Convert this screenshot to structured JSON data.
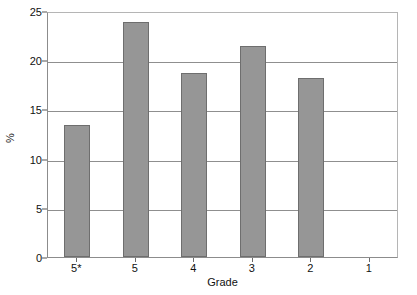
{
  "chart_data": {
    "type": "bar",
    "title": "",
    "subtitle": "",
    "xlabel": "Grade",
    "ylabel": "%",
    "categories": [
      "5*",
      "5",
      "4",
      "3",
      "2",
      "1"
    ],
    "values": [
      13.4,
      23.9,
      18.7,
      21.4,
      18.2,
      0
    ],
    "series": [
      {
        "name": "Percentage of candidates",
        "values": [
          13.4,
          23.9,
          18.7,
          21.4,
          18.2,
          0
        ]
      }
    ],
    "ylim": [
      0,
      25
    ],
    "yticks": [
      0,
      5,
      10,
      15,
      20,
      25
    ],
    "ytick_labels": [
      "0",
      "5",
      "10",
      "15",
      "20",
      "25"
    ],
    "grid": true,
    "grid_axis": "y",
    "legend": false,
    "legend_position": "none",
    "bar_color": "#969696",
    "bar_edge_color": "#6e6e6e",
    "frame_color": "#8c8c8c",
    "gridline_color": "#8f8f8f",
    "background_color": "#ffffff",
    "text_color": "#111111",
    "annotations": []
  },
  "axes": {
    "y_title": "%",
    "x_title": "Grade"
  }
}
